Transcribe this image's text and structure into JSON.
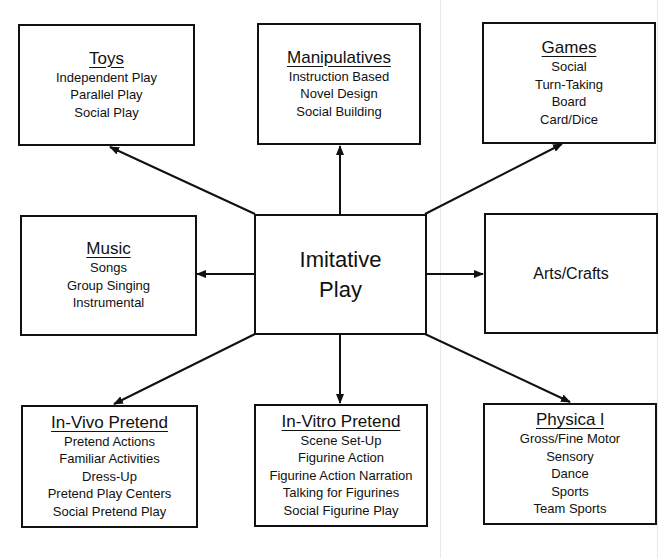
{
  "diagram": {
    "center": {
      "lines": [
        "Imitative",
        "Play"
      ]
    },
    "nodes": {
      "toys": {
        "title": "Toys",
        "items": [
          "Independent Play",
          "Parallel Play",
          "Social Play"
        ]
      },
      "manipulatives": {
        "title": "Manipulatives",
        "items": [
          "Instruction Based",
          "Novel Design",
          "Social Building"
        ]
      },
      "games": {
        "title": "Games",
        "items": [
          "Social",
          "Turn-Taking",
          "Board",
          "Card/Dice"
        ]
      },
      "music": {
        "title": "Music",
        "items": [
          "Songs",
          "Group Singing",
          "Instrumental"
        ]
      },
      "arts_crafts": {
        "label": "Arts/Crafts"
      },
      "in_vivo": {
        "title": "In-Vivo Pretend",
        "items": [
          "Pretend Actions",
          "Familiar Activities",
          "Dress-Up",
          "Pretend Play Centers",
          "Social Pretend Play"
        ]
      },
      "in_vitro": {
        "title": "In-Vitro Pretend",
        "items": [
          "Scene Set-Up",
          "Figurine Action",
          "Figurine Action Narration",
          "Talking for Figurines",
          "Social Figurine Play"
        ]
      },
      "physical": {
        "title": "Physica l",
        "items": [
          "Gross/Fine Motor",
          "Sensory",
          "Dance",
          "Sports",
          "Team Sports"
        ]
      }
    },
    "edges": [
      {
        "from": "center",
        "to": "toys"
      },
      {
        "from": "center",
        "to": "manipulatives"
      },
      {
        "from": "center",
        "to": "games"
      },
      {
        "from": "center",
        "to": "music"
      },
      {
        "from": "center",
        "to": "arts_crafts"
      },
      {
        "from": "center",
        "to": "in_vivo"
      },
      {
        "from": "center",
        "to": "in_vitro"
      },
      {
        "from": "center",
        "to": "physical"
      }
    ],
    "colors": {
      "line": "#111111",
      "background": "#ffffff"
    }
  }
}
